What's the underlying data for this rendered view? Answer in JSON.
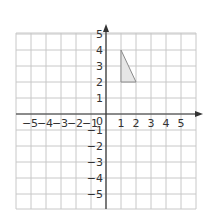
{
  "diagram": {
    "type": "coordinate-grid",
    "x_axis": {
      "ticks": [
        "-5",
        "-4",
        "-3",
        "-2",
        "-1",
        "1",
        "2",
        "3",
        "4",
        "5"
      ],
      "min": -6,
      "max": 6
    },
    "y_axis": {
      "ticks": [
        "5",
        "4",
        "3",
        "2",
        "1",
        "-1",
        "-2",
        "-3",
        "-4",
        "-5"
      ],
      "min": -6,
      "max": 5
    },
    "origin_label": "0",
    "shape": {
      "name": "triangle",
      "vertices": [
        [
          1,
          4
        ],
        [
          1,
          2
        ],
        [
          2,
          2
        ]
      ],
      "fill": "#e6e6e6",
      "stroke": "#8a8a8a"
    },
    "colors": {
      "grid": "#c8c8c8",
      "axis": "#333333"
    }
  }
}
